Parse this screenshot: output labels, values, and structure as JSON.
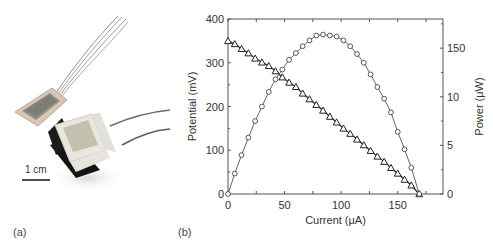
{
  "panels": {
    "a_label": "(a)",
    "b_label": "(b)",
    "photo": {
      "scale_bar_label": "1 cm",
      "description": "Photograph of two devices with wire leads"
    }
  },
  "chart_data": {
    "type": "line",
    "title": "",
    "xlabel": "Current (μA)",
    "ylabel": "Potential (mV)",
    "y2label": "Power (μW)",
    "xlim": [
      0,
      190
    ],
    "ylim": [
      0,
      400
    ],
    "y2lim": [
      0,
      18
    ],
    "xticks": [
      0,
      50,
      100,
      150
    ],
    "xtick_labels": [
      "0",
      "50",
      "100",
      "150"
    ],
    "xminor_ticks": [
      25,
      75,
      125,
      175
    ],
    "yticks": [
      0,
      100,
      200,
      300,
      400
    ],
    "ytick_labels": [
      "0",
      "100",
      "200",
      "300",
      "400"
    ],
    "y2ticks": [
      0,
      5,
      10,
      15
    ],
    "y2tick_labels": [
      "0",
      "5",
      "10",
      "150"
    ],
    "grid": false,
    "legend": null,
    "series": [
      {
        "name": "Potential",
        "axis": "left",
        "marker": "triangle-open",
        "x": [
          0,
          6,
          12,
          18,
          24,
          30,
          36,
          42,
          48,
          54,
          60,
          66,
          72,
          78,
          84,
          90,
          96,
          102,
          108,
          114,
          120,
          126,
          132,
          138,
          144,
          150,
          156,
          162,
          169
        ],
        "y": [
          350,
          343,
          332,
          322,
          310,
          301,
          293,
          281,
          267,
          255,
          245,
          230,
          217,
          204,
          191,
          177,
          164,
          150,
          138,
          125,
          112,
          99,
          86,
          74,
          60,
          47,
          33,
          20,
          0
        ]
      },
      {
        "name": "Power",
        "axis": "right",
        "marker": "circle-open",
        "x": [
          0,
          6,
          12,
          18,
          24,
          30,
          36,
          42,
          48,
          54,
          60,
          66,
          72,
          78,
          84,
          90,
          96,
          102,
          108,
          114,
          120,
          126,
          132,
          138,
          144,
          150,
          156,
          162,
          169
        ],
        "y": [
          0,
          2.1,
          4.0,
          5.8,
          7.5,
          9.0,
          10.5,
          11.8,
          12.8,
          13.8,
          14.5,
          15.2,
          15.8,
          16.3,
          16.4,
          16.3,
          16.2,
          15.8,
          15.2,
          14.4,
          13.5,
          12.3,
          11.0,
          9.8,
          8.4,
          6.4,
          4.6,
          2.7,
          0
        ]
      }
    ]
  }
}
